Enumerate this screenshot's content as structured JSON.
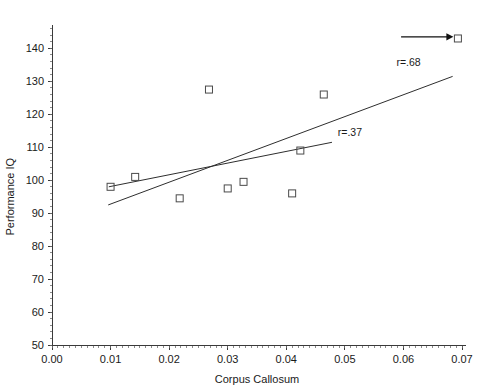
{
  "chart_data": {
    "type": "scatter",
    "title": "",
    "xlabel": "Corpus Callosum",
    "ylabel": "Performance IQ",
    "xlim": [
      0.0,
      0.07
    ],
    "ylim": [
      50,
      148
    ],
    "grid": false,
    "legend_position": "none",
    "xticks": [
      "0.00",
      "0.01",
      "0.02",
      "0.03",
      "0.04",
      "0.05",
      "0.06",
      "0.07"
    ],
    "xtick_values": [
      0.0,
      0.01,
      0.02,
      0.03,
      0.04,
      0.05,
      0.06,
      0.07
    ],
    "yticks": [
      "50",
      "60",
      "70",
      "80",
      "90",
      "100",
      "110",
      "120",
      "130",
      "140"
    ],
    "ytick_values": [
      50,
      60,
      70,
      80,
      90,
      100,
      110,
      120,
      130,
      140
    ],
    "points": [
      {
        "x": 0.01,
        "y": 98.0
      },
      {
        "x": 0.0142,
        "y": 101.0
      },
      {
        "x": 0.0218,
        "y": 94.5
      },
      {
        "x": 0.0268,
        "y": 127.5
      },
      {
        "x": 0.03,
        "y": 97.5
      },
      {
        "x": 0.0327,
        "y": 99.5
      },
      {
        "x": 0.041,
        "y": 96.0
      },
      {
        "x": 0.0424,
        "y": 109.0
      },
      {
        "x": 0.0464,
        "y": 126.0
      },
      {
        "x": 0.0693,
        "y": 143.0
      }
    ],
    "marker": "open-square",
    "series": [
      {
        "name": "regression-with-outlier",
        "label": "r=.68",
        "r": 0.68,
        "x0": 0.0096,
        "y0": 92.5,
        "x1": 0.0684,
        "y1": 131.5
      },
      {
        "name": "regression-without-outlier",
        "label": "r=.37",
        "r": 0.37,
        "x0": 0.0097,
        "y0": 98.0,
        "x1": 0.0478,
        "y1": 111.5
      }
    ],
    "annotations": [
      {
        "name": "r68-label",
        "text": "r=.68",
        "x": 0.0588,
        "y": 134.5
      },
      {
        "name": "r37-label",
        "text": "r=.37",
        "x": 0.0488,
        "y": 113.5
      },
      {
        "name": "outlier-arrow",
        "text": "",
        "x_start": 0.0687,
        "x_end": 0.0686,
        "y": 143.5,
        "tail_x": 0.0596,
        "points_to": {
          "x": 0.0693,
          "y": 143.0
        }
      }
    ]
  },
  "colors": {
    "background": "#ffffff",
    "axis": "#3a3a3a",
    "marker_stroke": "#4a4a4a",
    "line": "#2e2e2e",
    "text": "#1a1a1a",
    "arrow": "#111111"
  }
}
